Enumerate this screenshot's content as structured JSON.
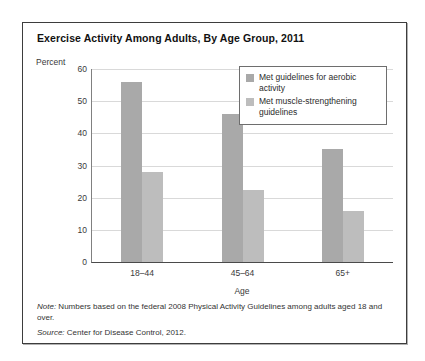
{
  "chart_data": {
    "type": "bar",
    "title": "Exercise Activity Among Adults, By Age Group, 2011",
    "xlabel": "Age",
    "ylabel": "Percent",
    "categories": [
      "18–44",
      "45–64",
      "65+"
    ],
    "ylim": [
      0,
      60
    ],
    "yticks": [
      0,
      10,
      20,
      30,
      40,
      50,
      60
    ],
    "grid": true,
    "legend_position": "top-right",
    "series": [
      {
        "name": "Met guidelines for aerobic activity",
        "color": "#a9a9a9",
        "values": [
          56,
          46,
          35
        ]
      },
      {
        "name": "Met muscle-strengthening guidelines",
        "color": "#bdbdbd",
        "values": [
          28,
          22.5,
          16
        ]
      }
    ],
    "note_prefix": "Note:",
    "note_text": " Numbers based on the federal 2008 Physical Activity Guidelines among adults aged 18 and over.",
    "source_prefix": "Source:",
    "source_text": " Center for Disease Control, 2012."
  }
}
